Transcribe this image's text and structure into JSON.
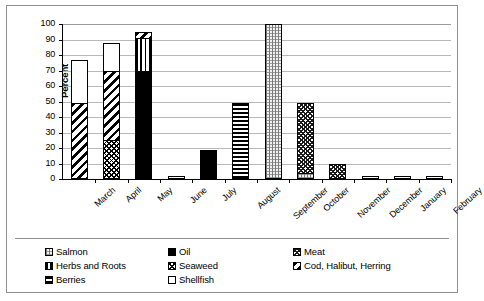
{
  "chart_data": {
    "type": "bar",
    "subtype": "stacked",
    "title": "",
    "xlabel": "",
    "ylabel": "Percent",
    "ylim": [
      0,
      100
    ],
    "yticks": [
      0,
      10,
      20,
      30,
      40,
      50,
      60,
      70,
      80,
      90,
      100
    ],
    "grid": true,
    "legend_position": "bottom",
    "categories": [
      "March",
      "April",
      "May",
      "June",
      "July",
      "August",
      "September",
      "October",
      "November",
      "December",
      "January",
      "February"
    ],
    "series": [
      {
        "name": "Salmon",
        "pattern": "p-salmon",
        "values": [
          0,
          0,
          0,
          0,
          0,
          0,
          100,
          4,
          0,
          0,
          0,
          0
        ]
      },
      {
        "name": "Oil",
        "pattern": "p-oil",
        "values": [
          0,
          0,
          70,
          0,
          19,
          0,
          0,
          0,
          0,
          0,
          0,
          0
        ]
      },
      {
        "name": "Meat",
        "pattern": "p-meat",
        "values": [
          0,
          0,
          0,
          0,
          0,
          0,
          0,
          45,
          10,
          0,
          0,
          0
        ]
      },
      {
        "name": "Herbs and Roots",
        "pattern": "p-herbs",
        "values": [
          0,
          0,
          21,
          0,
          0,
          0,
          0,
          0,
          0,
          0,
          0,
          0
        ]
      },
      {
        "name": "Seaweed",
        "pattern": "p-seaweed",
        "values": [
          0,
          25,
          0,
          0,
          0,
          0,
          0,
          0,
          0,
          0,
          0,
          0
        ]
      },
      {
        "name": "Cod, Halibut, Herring",
        "pattern": "p-cod",
        "values": [
          49,
          45,
          4,
          0,
          0,
          0,
          0,
          0,
          0,
          0,
          0,
          0
        ]
      },
      {
        "name": "Berries",
        "pattern": "p-berries",
        "values": [
          0,
          0,
          0,
          0,
          0,
          49,
          0,
          0,
          0,
          0,
          0,
          0
        ]
      },
      {
        "name": "Shellfish",
        "pattern": "p-shellfish",
        "values": [
          28,
          18,
          0,
          2,
          0,
          0,
          0,
          0,
          0,
          2,
          2,
          2
        ]
      }
    ],
    "stack_order": {
      "March": [
        {
          "s": "Cod, Halibut, Herring",
          "v": 49
        },
        {
          "s": "Shellfish",
          "v": 28
        }
      ],
      "April": [
        {
          "s": "Seaweed",
          "v": 25
        },
        {
          "s": "Cod, Halibut, Herring",
          "v": 45
        },
        {
          "s": "Shellfish",
          "v": 18
        }
      ],
      "May": [
        {
          "s": "Oil",
          "v": 70
        },
        {
          "s": "Herbs and Roots",
          "v": 21
        },
        {
          "s": "Cod, Halibut, Herring",
          "v": 4
        }
      ],
      "June": [
        {
          "s": "Shellfish",
          "v": 2
        }
      ],
      "July": [
        {
          "s": "Oil",
          "v": 19
        }
      ],
      "August": [
        {
          "s": "Berries",
          "v": 49
        }
      ],
      "September": [
        {
          "s": "Salmon",
          "v": 100
        }
      ],
      "October": [
        {
          "s": "Salmon",
          "v": 4
        },
        {
          "s": "Meat",
          "v": 45
        }
      ],
      "November": [
        {
          "s": "Meat",
          "v": 10
        }
      ],
      "December": [
        {
          "s": "Shellfish",
          "v": 2
        }
      ],
      "January": [
        {
          "s": "Shellfish",
          "v": 2
        }
      ],
      "February": [
        {
          "s": "Shellfish",
          "v": 2
        }
      ]
    },
    "totals": [
      77,
      88,
      95,
      2,
      19,
      49,
      100,
      49,
      10,
      2,
      2,
      2
    ]
  },
  "legend": {
    "columns": [
      [
        {
          "label": "Salmon",
          "pattern": "p-salmon"
        },
        {
          "label": "Herbs and Roots",
          "pattern": "p-herbs"
        },
        {
          "label": "Berries",
          "pattern": "p-berries"
        }
      ],
      [
        {
          "label": "Oil",
          "pattern": "p-oil"
        },
        {
          "label": "Seaweed",
          "pattern": "p-seaweed"
        },
        {
          "label": "Shellfish",
          "pattern": "p-shellfish"
        }
      ],
      [
        {
          "label": "Meat",
          "pattern": "p-meat"
        },
        {
          "label": "Cod, Halibut, Herring",
          "pattern": "p-cod"
        }
      ]
    ]
  },
  "colors": {
    "ink": "#000000",
    "gridline": "#b9b9b9",
    "frame": "#8f8f8f",
    "plot_background": "#ffffff"
  }
}
